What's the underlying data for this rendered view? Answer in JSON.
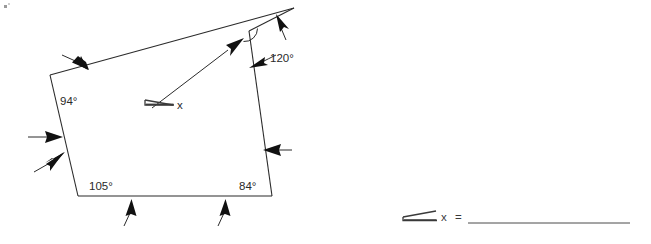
{
  "page": {
    "title": "Angle Measure Worksheet Figure",
    "background_color": "#ffffff",
    "ink_color": "#2b2b2b",
    "width": 651,
    "height": 244
  },
  "figure": {
    "name": "irregular-pentagon-with-angle-labels",
    "shape": "pentagon",
    "vertex_count": 5,
    "vertices": [
      {
        "id": "A",
        "label": "top-left-vertex",
        "x": 50,
        "y": 75
      },
      {
        "id": "B",
        "label": "apex-vertex",
        "x": 294,
        "y": 8
      },
      {
        "id": "C",
        "label": "upper-right-notch-vertex",
        "x": 249,
        "y": 31
      },
      {
        "id": "D",
        "label": "bottom-right-vertex",
        "x": 272,
        "y": 196
      },
      {
        "id": "E",
        "label": "bottom-left-vertex",
        "x": 78,
        "y": 196
      }
    ],
    "labels": {
      "top_left_angle": "94°",
      "bottom_left_angle": "105°",
      "bottom_right_angle": "84°",
      "apex_angle": "120°",
      "unknown_angle": "x"
    },
    "tick_arrow_count": 7,
    "arrow_color": "#111111"
  },
  "answer": {
    "angle_symbol": "angle-icon",
    "variable": "x",
    "equals": "=",
    "blank_value": "",
    "rule_width": 198
  }
}
